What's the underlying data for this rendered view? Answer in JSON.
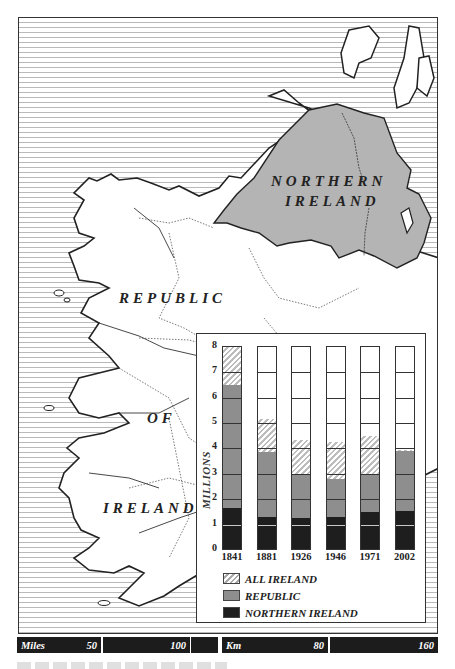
{
  "map": {
    "labels": {
      "northern_ireland_line1": "NORTHERN",
      "northern_ireland_line2": "IRELAND",
      "republic": "REPUBLIC",
      "of": "OF",
      "ireland": "IRELAND"
    },
    "colors": {
      "sea_lines": "#b9b9b9",
      "land": "#ffffff",
      "northern_ireland_fill": "#b4b4b4",
      "coastline": "#222222"
    }
  },
  "scale_bar": {
    "miles_label": "Miles",
    "miles_50": "50",
    "miles_100": "100",
    "km_label": "Km",
    "km_80": "80",
    "km_160": "160"
  },
  "legend": {
    "all_ireland": "ALL IRELAND",
    "republic": "REPUBLIC",
    "northern_ireland": "NORTHERN IRELAND"
  },
  "chart_data": {
    "type": "bar",
    "layout": "overlapping bars drawn from zero (All Ireland behind, Republic, Northern Ireland in front)",
    "title": "",
    "xlabel": "",
    "ylabel": "MILLIONS",
    "ylim": [
      0,
      8
    ],
    "yticks": [
      "0",
      "1",
      "2",
      "3",
      "4",
      "5",
      "6",
      "7",
      "8"
    ],
    "grid": true,
    "legend_position": "bottom-left inside panel",
    "categories": [
      "1841",
      "1881",
      "1926",
      "1946",
      "1971",
      "2002"
    ],
    "series": [
      {
        "name": "ALL IRELAND",
        "pattern": "hatched",
        "color": "#bdbdbd",
        "values": [
          8.2,
          5.15,
          4.35,
          4.25,
          4.5,
          3.95
        ]
      },
      {
        "name": "REPUBLIC",
        "color": "#8e8e8e",
        "values": [
          6.5,
          3.85,
          2.95,
          2.8,
          3.0,
          3.9
        ]
      },
      {
        "name": "NORTHERN IRELAND",
        "color": "#1e1e1e",
        "values": [
          1.65,
          1.3,
          1.25,
          1.3,
          1.5,
          1.55
        ]
      }
    ]
  }
}
